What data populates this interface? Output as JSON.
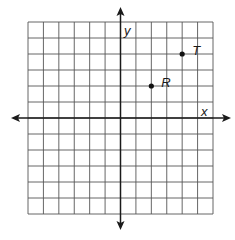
{
  "diagram": {
    "type": "coordinate-plane",
    "grid": {
      "x_min": -6,
      "x_max": 6,
      "y_min": -6,
      "y_max": 6,
      "step": 1,
      "line_color": "#555555"
    },
    "axes": {
      "x_label": "x",
      "y_label": "y",
      "color": "#1a1a1a"
    },
    "points": [
      {
        "label": "R",
        "x": 2,
        "y": 2
      },
      {
        "label": "T",
        "x": 4,
        "y": 4
      }
    ]
  }
}
